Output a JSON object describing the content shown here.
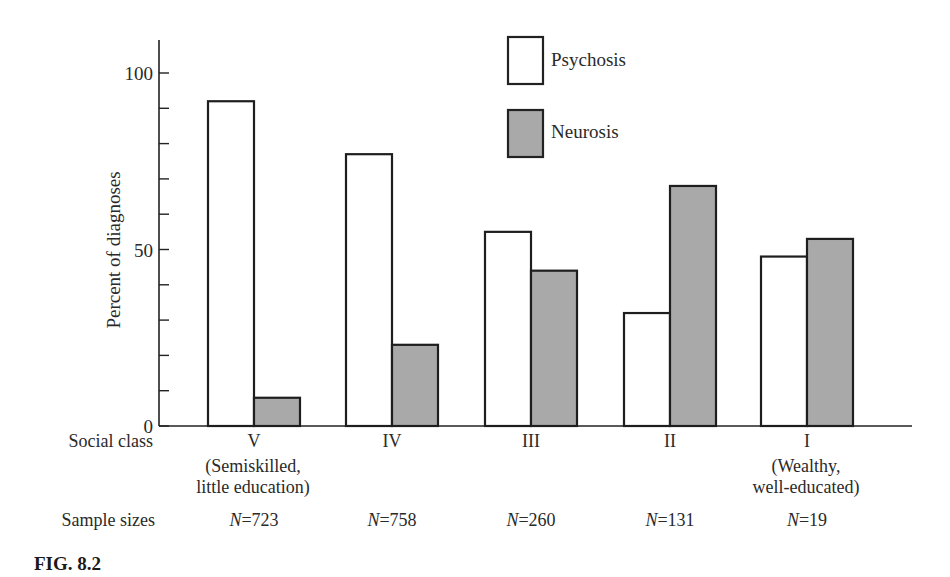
{
  "figure_label": "FIG. 8.2",
  "chart_data": {
    "type": "bar",
    "title": "",
    "xlabel": "Social class",
    "ylabel": "Percent of diagnoses",
    "ylim": [
      0,
      100
    ],
    "yticks_labeled": [
      0,
      50,
      100
    ],
    "ytick_step": 10,
    "grid": false,
    "legend_position": "top-center",
    "categories": [
      "V",
      "IV",
      "III",
      "II",
      "I"
    ],
    "category_notes": [
      "(Semiskilled,\nlittle education)",
      "",
      "",
      "",
      "(Wealthy,\nwell-educated)"
    ],
    "series": [
      {
        "name": "Psychosis",
        "fill": "#ffffff",
        "values": [
          92,
          77,
          55,
          32,
          48
        ]
      },
      {
        "name": "Neurosis",
        "fill": "#a9a9a9",
        "values": [
          8,
          23,
          44,
          68,
          53
        ]
      }
    ],
    "sample_sizes_label": "Sample sizes",
    "sample_sizes": [
      "N=723",
      "N=758",
      "N=260",
      "N=131",
      "N=19"
    ]
  },
  "labels": {
    "y_axis": "Percent of diagnoses",
    "x_axis": "Social class",
    "sample_sizes": "Sample sizes",
    "legend_psychosis": "Psychosis",
    "legend_neurosis": "Neurosis",
    "note_v_line1": "(Semiskilled,",
    "note_v_line2": "little education)",
    "note_i_line1": "(Wealthy,",
    "note_i_line2": "well-educated)"
  }
}
